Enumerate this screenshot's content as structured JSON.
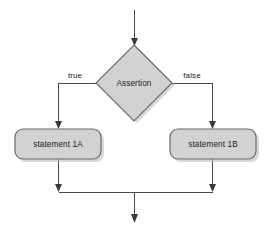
{
  "diagram": {
    "type": "flowchart",
    "canvas": {
      "width": 268,
      "height": 238,
      "background": "#ffffff"
    },
    "style": {
      "shape_fill": "#d2d2d2",
      "shape_stroke": "#6b6b6b",
      "shadow_color": "#b9b9b9",
      "line_color": "#4a4a4a",
      "arrow_color": "#3a3a3a",
      "text_color": "#1b1b1b"
    },
    "nodes": {
      "entry": {
        "name": "entry-arrow",
        "shape": "arrow"
      },
      "decision": {
        "name": "assertion-decision",
        "label": "Assertion",
        "shape": "diamond",
        "cx": 134,
        "cy": 83.5,
        "rx": 39,
        "ry": 39
      },
      "true_branch_node": {
        "name": "statement-1a",
        "label": "statement 1A",
        "shape": "rounded-rect",
        "x": 15,
        "y": 129,
        "w": 86,
        "h": 30
      },
      "false_branch_node": {
        "name": "statement-1b",
        "label": "statement 1B",
        "shape": "rounded-rect",
        "x": 170,
        "y": 129,
        "w": 86,
        "h": 30
      },
      "exit": {
        "name": "exit-arrow",
        "shape": "arrow"
      }
    },
    "edges": [
      {
        "name": "entry-to-decision",
        "from": "entry",
        "to": "decision",
        "label": ""
      },
      {
        "name": "decision-true-edge",
        "from": "decision",
        "to": "statement-1a",
        "label": "true",
        "label_x": 75,
        "label_y": 76
      },
      {
        "name": "decision-false-edge",
        "from": "decision",
        "to": "statement-1b",
        "label": "false",
        "label_x": 192,
        "label_y": 76
      },
      {
        "name": "statement-1a-to-merge",
        "from": "statement-1a",
        "to": "merge",
        "label": ""
      },
      {
        "name": "statement-1b-to-merge",
        "from": "statement-1b",
        "to": "merge",
        "label": ""
      },
      {
        "name": "merge-to-exit",
        "from": "merge",
        "to": "exit",
        "label": ""
      }
    ]
  }
}
